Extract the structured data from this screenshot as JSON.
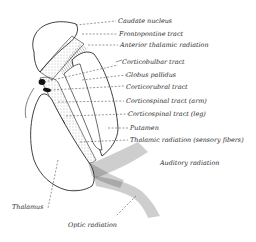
{
  "figure": {
    "colors": {
      "ink": "#2a2a2a",
      "background": "#ffffff",
      "stipple": "#8a8a8a"
    }
  },
  "labels": {
    "caudate_nucleus": "Caudate nucleus",
    "frontopontine_tract": "Frontopontine tract",
    "anterior_thalamic_radiation": "Anterior thalamic radiation",
    "corticobulbar_tract": "Corticobulbar tract",
    "globus_pallidus": "Globus pallidus",
    "corticorubral_tract": "Corticorubral tract",
    "corticospinal_arm": "Corticospinal tract (arm)",
    "corticospinal_leg": "Corticospinal tract (leg)",
    "putamen": "Putamen",
    "thalamic_radiation": "Thalamic radiation (sensory fibers)",
    "auditory_radiation": "Auditory radiation",
    "thalamus": "Thalamus",
    "optic_radiation": "Optic radiation"
  }
}
